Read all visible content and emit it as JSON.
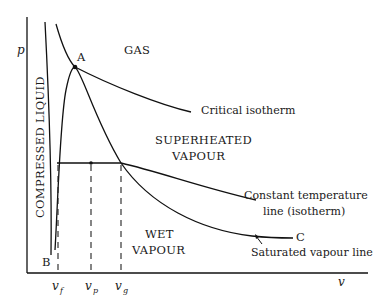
{
  "figure": {
    "type": "p-v diagram",
    "axes": {
      "y_label": "p",
      "x_label": "v"
    },
    "regions": {
      "gas": "GAS",
      "superheated_line1": "SUPERHEATED",
      "superheated_line2": "VAPOUR",
      "wet_line1": "WET",
      "wet_line2": "VAPOUR",
      "compressed_liquid": "COMPRESSED LIQUID"
    },
    "points": {
      "a": "A",
      "b": "B",
      "c": "C"
    },
    "annotations": {
      "critical_isotherm": "Critical isotherm",
      "constant_temp_line1": "Constant temperature",
      "constant_temp_line2": "line (isotherm)",
      "saturated_vapour_line": "Saturated vapour line"
    },
    "x_ticks": [
      {
        "base": "v",
        "sub": "f"
      },
      {
        "base": "v",
        "sub": "p"
      },
      {
        "base": "v",
        "sub": "g"
      }
    ],
    "colors": {
      "line": "#111111",
      "background": "#ffffff"
    }
  }
}
